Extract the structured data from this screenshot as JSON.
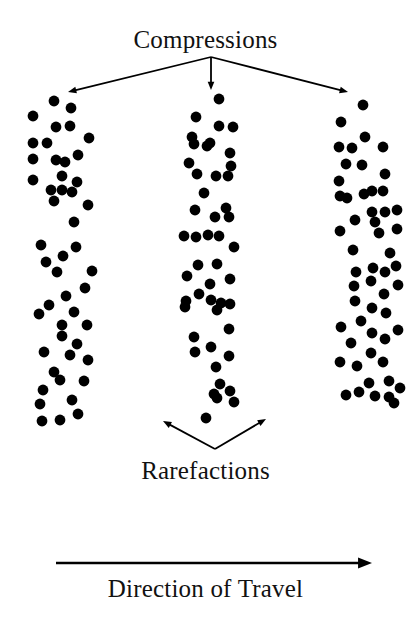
{
  "figure": {
    "kind": "longitudinal-wave-diagram",
    "background_color": "#ffffff",
    "ink_color": "#000000",
    "width": 411,
    "height": 626
  },
  "labels": {
    "compressions": "Compressions",
    "rarefactions": "Rarefactions",
    "direction_of_travel": "Direction of Travel"
  },
  "chart_data": {
    "type": "scatter",
    "title": "Compressions",
    "subtitle": "Rarefactions",
    "xlabel": "Direction of Travel",
    "ylabel": "",
    "grid": false,
    "legend": null,
    "xlim": [
      0,
      411
    ],
    "ylim": [
      0,
      626
    ],
    "annotations": [
      {
        "text": "Compressions",
        "x": 214,
        "y": 38,
        "font_size": 25,
        "points_to": [
          {
            "x": 68,
            "y": 92
          },
          {
            "x": 211,
            "y": 90
          },
          {
            "x": 348,
            "y": 92
          }
        ],
        "vertex": {
          "x": 211,
          "y": 57
        }
      },
      {
        "text": "Rarefactions",
        "x": 214,
        "y": 469,
        "font_size": 25,
        "points_to": [
          {
            "x": 163,
            "y": 421
          },
          {
            "x": 266,
            "y": 419
          }
        ],
        "vertex": {
          "x": 215,
          "y": 449
        }
      },
      {
        "text": "Direction of Travel",
        "x": 214,
        "y": 587,
        "font_size": 25,
        "axis_arrow": {
          "x1": 56,
          "y1": 563,
          "x2": 372,
          "y2": 563
        }
      }
    ],
    "marker": {
      "shape": "circle",
      "radius": 5.4,
      "color": "#000000"
    },
    "series": [
      {
        "name": "compression-band-left",
        "color": "#000000",
        "points": [
          [
            54,
            101
          ],
          [
            33,
            116
          ],
          [
            71,
            108
          ],
          [
            56,
            127
          ],
          [
            70,
            126
          ],
          [
            33,
            143
          ],
          [
            47,
            143
          ],
          [
            89,
            138
          ],
          [
            78,
            155
          ],
          [
            33,
            159
          ],
          [
            56,
            160
          ],
          [
            65,
            162
          ],
          [
            62,
            176
          ],
          [
            77,
            182
          ],
          [
            33,
            180
          ],
          [
            51,
            190
          ],
          [
            62,
            190
          ],
          [
            72,
            192
          ],
          [
            88,
            205
          ],
          [
            54,
            201
          ],
          [
            74,
            222
          ],
          [
            76,
            247
          ],
          [
            63,
            256
          ],
          [
            41,
            245
          ],
          [
            46,
            262
          ],
          [
            57,
            272
          ],
          [
            92,
            271
          ],
          [
            85,
            288
          ],
          [
            66,
            296
          ],
          [
            49,
            305
          ],
          [
            74,
            312
          ],
          [
            62,
            325
          ],
          [
            39,
            314
          ],
          [
            62,
            336
          ],
          [
            87,
            325
          ],
          [
            77,
            344
          ],
          [
            44,
            352
          ],
          [
            70,
            355
          ],
          [
            88,
            360
          ],
          [
            54,
            372
          ],
          [
            60,
            380
          ],
          [
            84,
            381
          ],
          [
            43,
            390
          ],
          [
            72,
            400
          ],
          [
            40,
            404
          ],
          [
            78,
            414
          ],
          [
            60,
            420
          ],
          [
            42,
            421
          ]
        ]
      },
      {
        "name": "compression-band-middle",
        "color": "#000000",
        "points": [
          [
            219,
            99
          ],
          [
            196,
            117
          ],
          [
            219,
            126
          ],
          [
            233,
            127
          ],
          [
            192,
            137
          ],
          [
            194,
            144
          ],
          [
            207,
            146
          ],
          [
            210,
            143
          ],
          [
            230,
            153
          ],
          [
            189,
            163
          ],
          [
            197,
            174
          ],
          [
            216,
            176
          ],
          [
            228,
            176
          ],
          [
            231,
            166
          ],
          [
            204,
            193
          ],
          [
            195,
            210
          ],
          [
            226,
            208
          ],
          [
            215,
            217
          ],
          [
            229,
            217
          ],
          [
            184,
            236
          ],
          [
            196,
            237
          ],
          [
            208,
            235
          ],
          [
            219,
            236
          ],
          [
            234,
            247
          ],
          [
            198,
            265
          ],
          [
            217,
            264
          ],
          [
            187,
            276
          ],
          [
            230,
            279
          ],
          [
            210,
            284
          ],
          [
            186,
            301
          ],
          [
            211,
            300
          ],
          [
            199,
            294
          ],
          [
            221,
            303
          ],
          [
            185,
            307
          ],
          [
            217,
            310
          ],
          [
            230,
            304
          ],
          [
            229,
            329
          ],
          [
            194,
            337
          ],
          [
            211,
            347
          ],
          [
            195,
            352
          ],
          [
            229,
            356
          ],
          [
            216,
            367
          ],
          [
            220,
            384
          ],
          [
            230,
            391
          ],
          [
            214,
            394
          ],
          [
            217,
            398
          ],
          [
            234,
            402
          ],
          [
            206,
            418
          ]
        ]
      },
      {
        "name": "compression-band-right",
        "color": "#000000",
        "points": [
          [
            363,
            105
          ],
          [
            341,
            122
          ],
          [
            365,
            137
          ],
          [
            339,
            147
          ],
          [
            352,
            148
          ],
          [
            383,
            147
          ],
          [
            346,
            164
          ],
          [
            362,
            165
          ],
          [
            385,
            174
          ],
          [
            339,
            181
          ],
          [
            372,
            191
          ],
          [
            383,
            191
          ],
          [
            347,
            198
          ],
          [
            364,
            194
          ],
          [
            340,
            196
          ],
          [
            372,
            212
          ],
          [
            385,
            212
          ],
          [
            397,
            210
          ],
          [
            355,
            220
          ],
          [
            375,
            222
          ],
          [
            340,
            231
          ],
          [
            379,
            233
          ],
          [
            397,
            229
          ],
          [
            353,
            250
          ],
          [
            390,
            253
          ],
          [
            356,
            272
          ],
          [
            373,
            268
          ],
          [
            385,
            272
          ],
          [
            396,
            266
          ],
          [
            354,
            286
          ],
          [
            371,
            281
          ],
          [
            384,
            294
          ],
          [
            398,
            285
          ],
          [
            355,
            301
          ],
          [
            372,
            308
          ],
          [
            386,
            313
          ],
          [
            341,
            327
          ],
          [
            361,
            321
          ],
          [
            372,
            333
          ],
          [
            385,
            339
          ],
          [
            398,
            330
          ],
          [
            351,
            343
          ],
          [
            371,
            353
          ],
          [
            340,
            362
          ],
          [
            357,
            366
          ],
          [
            383,
            362
          ],
          [
            369,
            383
          ],
          [
            389,
            381
          ],
          [
            400,
            388
          ],
          [
            346,
            395
          ],
          [
            359,
            392
          ],
          [
            375,
            396
          ],
          [
            389,
            397
          ],
          [
            394,
            403
          ]
        ]
      }
    ]
  }
}
